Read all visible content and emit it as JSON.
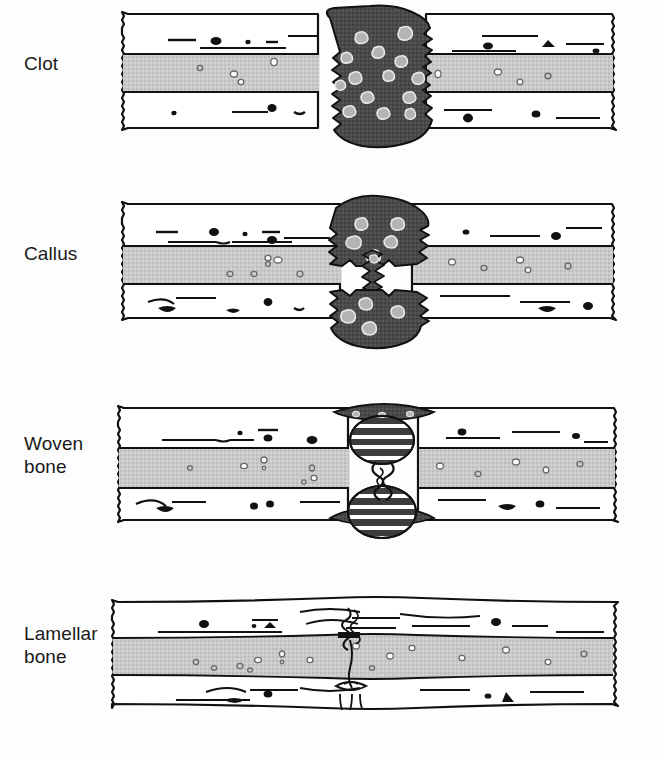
{
  "figure": {
    "background_color": "#fdfdfd",
    "width": 658,
    "height": 758
  },
  "colors": {
    "outline": "#111111",
    "cortical_bone": "#ffffff",
    "marrow_cavity": "#c9c9c9",
    "clot_dark": "#4a4a4a",
    "clot_inclusion": "#b4b4b4",
    "woven_band_dark": "#3d3d3d",
    "woven_band_light": "#d2d2d2",
    "speck_black": "#111111",
    "background": "#fdfdfd"
  },
  "panels": [
    {
      "id": "clot",
      "label": "Clot",
      "label_lines": [
        "Clot"
      ],
      "stage_index": 1,
      "top": 0,
      "label_top": 52,
      "description": "Fracture gap filled by a dark blood clot mass bridging both jagged bone ends"
    },
    {
      "id": "callus",
      "label": "Callus",
      "label_lines": [
        "Callus"
      ],
      "stage_index": 2,
      "top": 190,
      "label_top": 242,
      "description": "Soft callus forms as dark domes above and below the fracture with a narrowed central bridge"
    },
    {
      "id": "woven-bone",
      "label": "Woven bone",
      "label_lines": [
        "Woven",
        "bone"
      ],
      "stage_index": 3,
      "top": 390,
      "label_top": 432,
      "description": "Banded woven bone ovals replace the callus, thin dark periosteal arcs remain"
    },
    {
      "id": "lamellar-bone",
      "label": "Lamellar bone",
      "label_lines": [
        "Lamellar",
        "bone"
      ],
      "stage_index": 4,
      "top": 580,
      "label_top": 622,
      "description": "Remodelled lamellar bone restores the original contour leaving a faint fracture line"
    }
  ]
}
